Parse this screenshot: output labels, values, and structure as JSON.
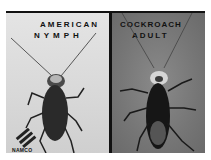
{
  "image": {
    "description": "Photograph comparing an American cockroach nymph and adult",
    "left_panel": {
      "line1": "AMERICAN",
      "line2": "NYMPH",
      "background": "#dcdcdc",
      "logo_text": "NAMCO"
    },
    "right_panel": {
      "line1": "COCKROACH",
      "line2": "ADULT",
      "background": "#7a7a7a"
    }
  }
}
